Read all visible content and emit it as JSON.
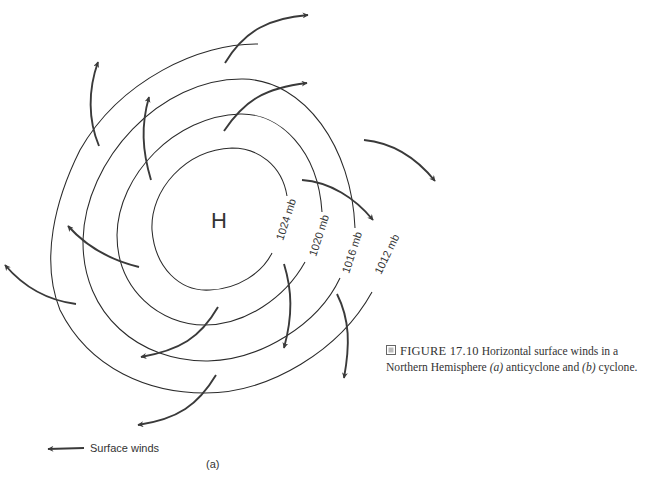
{
  "diagram": {
    "center_label": "H",
    "isobars": [
      {
        "label": "1024 mb"
      },
      {
        "label": "1020 mb"
      },
      {
        "label": "1016 mb"
      },
      {
        "label": "1012 mb"
      }
    ],
    "legend": {
      "label": "Surface winds",
      "icon": "arrow-left-icon"
    },
    "panel_label": "(a)",
    "stroke_color": "#2a2a2a",
    "arrow_color": "#3a3a3a"
  },
  "caption": {
    "icon": "figure-box-icon",
    "figure_number": "FIGURE 17.10",
    "text_before_a": "Horizontal surface winds in a Northern Hemisphere ",
    "a": "(a)",
    "text_mid": " anticyclone and ",
    "b": "(b)",
    "text_after": " cyclone."
  }
}
